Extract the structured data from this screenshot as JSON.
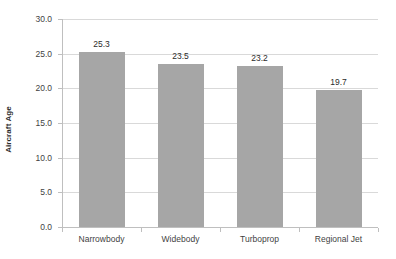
{
  "chart_data": {
    "type": "bar",
    "title": "",
    "subtitle": "",
    "xlabel": "",
    "ylabel": "Aircraft Age",
    "categories": [
      "Narrowbody",
      "Widebody",
      "Turboprop",
      "Regional Jet"
    ],
    "values": [
      25.3,
      23.5,
      23.2,
      19.7
    ],
    "value_labels": [
      "25.3",
      "23.5",
      "23.2",
      "19.7"
    ],
    "ylim": [
      0.0,
      30.0
    ],
    "ytick_values": [
      0.0,
      5.0,
      10.0,
      15.0,
      20.0,
      25.0,
      30.0
    ],
    "ytick_labels": [
      "0.0",
      "5.0",
      "10.0",
      "15.0",
      "20.0",
      "25.0",
      "30.0"
    ],
    "grid": true,
    "grid_axis": "y",
    "legend": false,
    "legend_position": "none",
    "bar_color": "#a6a6a6",
    "gridline_color": "#d9d9d9",
    "axis_color": "#bfbfbf",
    "text_color": "#3f3f3f",
    "background_color": "#ffffff",
    "data_labels_shown": true
  }
}
